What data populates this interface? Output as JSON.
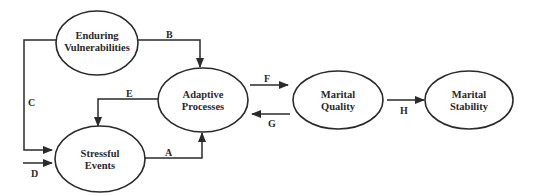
{
  "diagram": {
    "nodes": {
      "enduring_vulnerabilities": {
        "line1": "Enduring",
        "line2": "Vulnerabilities"
      },
      "adaptive_processes": {
        "line1": "Adaptive",
        "line2": "Processes"
      },
      "stressful_events": {
        "line1": "Stressful",
        "line2": "Events"
      },
      "marital_quality": {
        "line1": "Marital",
        "line2": "Quality"
      },
      "marital_stability": {
        "line1": "Marital",
        "line2": "Stability"
      }
    },
    "edges": {
      "A": {
        "label": "A",
        "from": "Stressful Events",
        "to": "Adaptive Processes"
      },
      "B": {
        "label": "B",
        "from": "Enduring Vulnerabilities",
        "to": "Adaptive Processes"
      },
      "C": {
        "label": "C",
        "from": "Enduring Vulnerabilities",
        "to": "Stressful Events"
      },
      "D": {
        "label": "D",
        "from": "external",
        "to": "Stressful Events"
      },
      "E": {
        "label": "E",
        "from": "Adaptive Processes",
        "to": "Stressful Events"
      },
      "F": {
        "label": "F",
        "from": "Adaptive Processes",
        "to": "Marital Quality"
      },
      "G": {
        "label": "G",
        "from": "Marital Quality",
        "to": "Adaptive Processes"
      },
      "H": {
        "label": "H",
        "from": "Marital Quality",
        "to": "Marital Stability"
      }
    }
  }
}
